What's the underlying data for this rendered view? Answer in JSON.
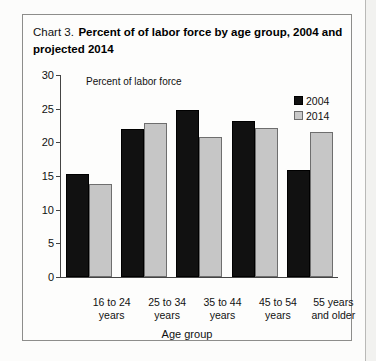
{
  "chart_box": {
    "title_prefix": "Chart 3.",
    "title_main": "Percent of of labor force by age group, 2004 and projected 2014"
  },
  "legend": {
    "position": "top-right",
    "items": [
      {
        "label": "2004",
        "color": "#111111",
        "swatch": "filled-square-icon"
      },
      {
        "label": "2014",
        "color": "#c9c9c9",
        "swatch": "outlined-square-icon"
      }
    ]
  },
  "axes": {
    "y_title": "Percent of labor force",
    "x_title": "Age group",
    "y_ticks": [
      "30",
      "25",
      "20",
      "15",
      "10",
      "5",
      "0"
    ]
  },
  "chart_data": {
    "type": "bar",
    "title": "Chart 3. Percent of of labor force by age group, 2004 and projected 2014",
    "xlabel": "Age group",
    "ylabel": "Percent of labor force",
    "ylim": [
      0,
      30
    ],
    "ytick_step": 5,
    "grid": false,
    "legend_position": "top-right",
    "categories": [
      "16 to 24 years",
      "25 to 34 years",
      "35 to 44 years",
      "45 to 54 years",
      "55 years and older"
    ],
    "category_lines": [
      [
        "16 to 24",
        "years"
      ],
      [
        "25 to 34",
        "years"
      ],
      [
        "35 to 44",
        "years"
      ],
      [
        "45 to 54",
        "years"
      ],
      [
        "55 years",
        "and older"
      ]
    ],
    "series": [
      {
        "name": "2004",
        "color": "#111111",
        "values": [
          15.3,
          22.0,
          24.8,
          23.2,
          15.9
        ]
      },
      {
        "name": "2014",
        "color": "#c6c6c6",
        "values": [
          13.8,
          22.8,
          20.8,
          22.1,
          21.5
        ]
      }
    ]
  }
}
